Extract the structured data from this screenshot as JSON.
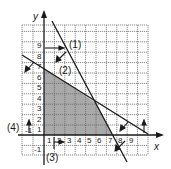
{
  "figure": {
    "type": "linear-programming feasible region graph",
    "colors": {
      "background": "#ffffff",
      "grid": "#6b6b6b",
      "lines": "#1a1a1a",
      "shading": "#a9a9a9"
    },
    "axes": {
      "x_label": "x",
      "y_label": "y",
      "x_ticks": [
        "-1",
        "1",
        "2",
        "3",
        "4",
        "5",
        "6",
        "7",
        "8",
        "9"
      ],
      "y_ticks": [
        "-1",
        "1",
        "2",
        "3",
        "4",
        "5",
        "6",
        "7",
        "8",
        "9"
      ],
      "x_range": [
        -2,
        10
      ],
      "y_range": [
        -2,
        10.5
      ]
    },
    "constraints": [
      {
        "id": "1",
        "label": "(1)"
      },
      {
        "id": "2",
        "label": "(2)"
      },
      {
        "id": "3",
        "label": "(3)"
      },
      {
        "id": "4",
        "label": "(4)"
      }
    ],
    "feasible_region": {
      "shaded": true,
      "approx_vertices": [
        [
          0,
          0
        ],
        [
          0,
          6.5
        ],
        [
          5,
          3.1
        ],
        [
          6.6,
          0
        ]
      ]
    }
  }
}
